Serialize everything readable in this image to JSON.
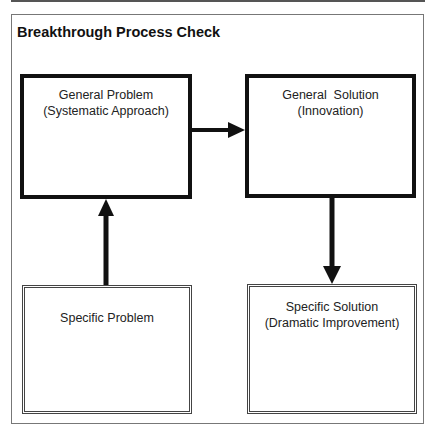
{
  "diagram": {
    "title": "Breakthrough Process Check",
    "nodes": [
      {
        "id": "general_problem",
        "lines": [
          "General Problem",
          "(Systematic Approach)"
        ]
      },
      {
        "id": "general_solution",
        "lines": [
          "General  Solution",
          "(Innovation)"
        ]
      },
      {
        "id": "specific_problem",
        "lines": [
          "Specific Problem"
        ]
      },
      {
        "id": "specific_solution",
        "lines": [
          "Specific Solution",
          "(Dramatic Improvement)"
        ]
      }
    ],
    "edges": [
      {
        "from": "specific_problem",
        "to": "general_problem"
      },
      {
        "from": "general_problem",
        "to": "general_solution"
      },
      {
        "from": "general_solution",
        "to": "specific_solution"
      }
    ]
  }
}
